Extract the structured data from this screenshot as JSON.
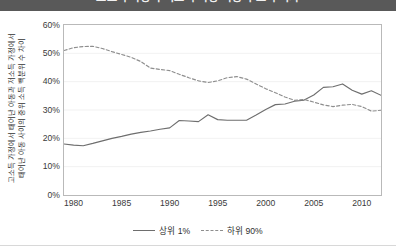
{
  "header": {
    "title": "고소득 가정과 저소득 가정 아동의 소득 격차"
  },
  "chart_data": {
    "type": "line",
    "title": "고소득 가정과 저소득 가정 아동의 소득 격차",
    "xlabel": "",
    "ylabel": "고소득 가정에서 태어난 아동과 저소득 가정에서 태어난 아동 사이의 중위 소득 백분위 수 차이",
    "ylabel_line1": "고소득 가정에서 태어난 아동과 저소득 가정에서",
    "ylabel_line2": "태어난 아동 사이의 중위 소득 백분위 수 차이",
    "ylim": [
      0,
      60
    ],
    "xlim": [
      1979,
      2012
    ],
    "yticks": [
      0,
      10,
      20,
      30,
      40,
      50,
      60
    ],
    "ytick_labels": [
      "0%",
      "10%",
      "20%",
      "30%",
      "40%",
      "50%",
      "60%"
    ],
    "xticks": [
      1980,
      1985,
      1990,
      1995,
      2000,
      2005,
      2010
    ],
    "xtick_labels": [
      "1980",
      "1985",
      "1990",
      "1995",
      "2000",
      "2005",
      "2010"
    ],
    "grid": true,
    "grid_axis": "y",
    "legend_position": "bottom",
    "x": [
      1979,
      1980,
      1981,
      1982,
      1983,
      1984,
      1985,
      1986,
      1987,
      1988,
      1989,
      1990,
      1991,
      1992,
      1993,
      1994,
      1995,
      1996,
      1997,
      1998,
      1999,
      2000,
      2001,
      2002,
      2003,
      2004,
      2005,
      2006,
      2007,
      2008,
      2009,
      2010,
      2011,
      2012
    ],
    "series": [
      {
        "name": "상위 1%",
        "style": "solid",
        "color": "#6e6e6e",
        "values": [
          18.0,
          17.6,
          17.4,
          18.2,
          19.1,
          20.0,
          20.7,
          21.5,
          22.1,
          22.6,
          23.2,
          23.7,
          26.3,
          26.1,
          25.9,
          28.3,
          26.6,
          26.4,
          26.4,
          26.4,
          28.2,
          30.2,
          31.9,
          32.1,
          33.1,
          33.5,
          35.3,
          38.0,
          38.2,
          39.2,
          37.0,
          35.6,
          36.8,
          35.2
        ]
      },
      {
        "name": "하위 90%",
        "style": "dashed",
        "color": "#8e8e8e",
        "values": [
          51.0,
          52.0,
          52.4,
          52.5,
          51.7,
          50.6,
          49.6,
          48.6,
          47.1,
          44.8,
          44.3,
          43.9,
          42.6,
          41.4,
          40.3,
          39.7,
          40.3,
          41.4,
          41.8,
          40.9,
          39.2,
          37.5,
          36.1,
          34.6,
          33.4,
          33.7,
          32.8,
          31.8,
          31.2,
          31.7,
          32.0,
          31.2,
          29.6,
          29.9
        ]
      }
    ]
  }
}
